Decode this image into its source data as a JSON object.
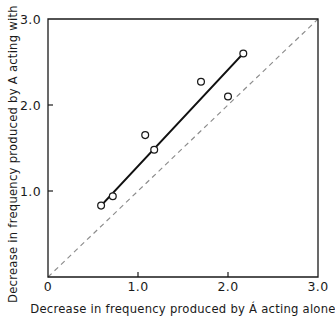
{
  "chart_data": {
    "type": "scatter",
    "title": "",
    "xlabel": "Decrease in frequency produced by Á acting alone",
    "ylabel": "Decrease in frequency produced by A acting with B",
    "xlim": [
      0,
      3.0
    ],
    "ylim": [
      0,
      3.0
    ],
    "grid": false,
    "legend": "none",
    "xticks": [
      {
        "value": 0,
        "label": "0"
      },
      {
        "value": 1.0,
        "label": "1.0"
      },
      {
        "value": 2.0,
        "label": "2.0"
      },
      {
        "value": 3.0,
        "label": "3.0"
      }
    ],
    "yticks": [
      {
        "value": 1.0,
        "label": "1.0"
      },
      {
        "value": 2.0,
        "label": "2.0"
      },
      {
        "value": 3.0,
        "label": "3.0"
      }
    ],
    "series": [
      {
        "name": "observations",
        "marker": "open-circle",
        "marker_color": "#1a1a1a",
        "points": [
          {
            "x": 0.59,
            "y": 0.83
          },
          {
            "x": 0.72,
            "y": 0.94
          },
          {
            "x": 1.08,
            "y": 1.65
          },
          {
            "x": 1.18,
            "y": 1.48
          },
          {
            "x": 1.7,
            "y": 2.27
          },
          {
            "x": 2.0,
            "y": 2.1
          },
          {
            "x": 2.17,
            "y": 2.6
          }
        ]
      }
    ],
    "lines": [
      {
        "name": "fitted-line",
        "style": "solid",
        "color": "#111111",
        "x": [
          0.59,
          2.17
        ],
        "y": [
          0.83,
          2.6
        ]
      },
      {
        "name": "identity-line",
        "style": "dashed",
        "color": "#8c8c8c",
        "x": [
          0.0,
          3.0
        ],
        "y": [
          0.0,
          3.0
        ]
      }
    ]
  },
  "plot_geometry": {
    "left_px": 48,
    "right_px": 318,
    "top_px": 19,
    "bottom_px": 277,
    "tick_length_px": 5
  }
}
